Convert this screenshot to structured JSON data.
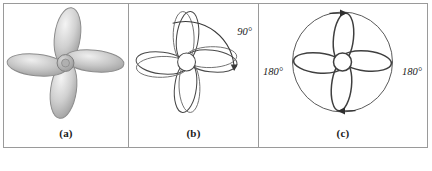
{
  "figure": {
    "panels": [
      {
        "id": "a",
        "caption": "(a)",
        "style": "shaded",
        "description": "four-lobed shaded rotor"
      },
      {
        "id": "b",
        "caption": "(b)",
        "style": "outline-doubled",
        "description": "four-lobed outline rotor with rotation arc",
        "annotations": [
          {
            "name": "rotation-angle",
            "label": "90°"
          }
        ]
      },
      {
        "id": "c",
        "caption": "(c)",
        "style": "outline-circle",
        "description": "four-lobed outline rotor inside circle with two arrows",
        "annotations": [
          {
            "name": "rotation-angle-left",
            "label": "180°"
          },
          {
            "name": "rotation-angle-right",
            "label": "180°"
          }
        ]
      }
    ]
  },
  "colors": {
    "frame_border": "#9a9a9a",
    "stroke": "#3a3a3a",
    "lobe_fill_light": "#f2f2f2",
    "lobe_fill_mid": "#c9c9c9",
    "lobe_fill_dark": "#a8a8a8",
    "hub": "#b5b5b5",
    "text": "#1a1a1a",
    "background": "#ffffff"
  }
}
